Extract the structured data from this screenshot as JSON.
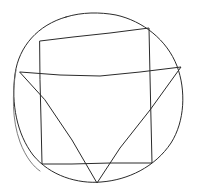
{
  "image": {
    "title": "Hand-drawn geometric figure",
    "description": "A pencil-style sketch of a circle containing an inscribed quadrilateral and an inscribed downward-pointing triangle",
    "width": 198,
    "height": 194,
    "background_color": "#ffffff",
    "medium": "pencil-sketch"
  },
  "style": {
    "stroke_color": "#2b2b2b",
    "stroke_color_light": "#6e6e6e",
    "stroke_width": 1,
    "stroke_width_light": 0.9
  },
  "shapes": {
    "circle": {
      "name": "circle",
      "center_x": 99,
      "center_y": 96,
      "radius_x": 85,
      "radius_y": 84,
      "top_y": 12,
      "bottom_y": 180,
      "left_x": 14,
      "right_x": 184,
      "has_double_closure_stroke": true,
      "path": "M 66 17 C 38 25 19 46 15 74 C 11 104 17 134 33 155 C 50 176 78 184 101 182 C 128 180 155 167 171 143 C 185 121 186 90 177 66 C 167 40 143 21 116 15 C 100 12 82 12 66 17 Z",
      "closure_path": "M 16 70 C 12 94 12 120 20 142 C 26 158 34 167 40 171"
    },
    "quadrilateral": {
      "name": "quadrilateral",
      "vertices": [
        {
          "label": "top-left",
          "x": 40,
          "y": 41
        },
        {
          "label": "top-right",
          "x": 149,
          "y": 28
        },
        {
          "label": "bottom-right",
          "x": 152,
          "y": 163
        },
        {
          "label": "bottom-left",
          "x": 42,
          "y": 164
        }
      ],
      "path": "M 40 41 L 73 37 L 110 33 L 149 28 L 150 76 L 151 120 L 152 163 L 110 163 L 72 164 L 42 164 L 41 120 L 40 80 Z"
    },
    "triangle": {
      "name": "triangle",
      "vertices": [
        {
          "label": "left",
          "x": 20,
          "y": 72
        },
        {
          "label": "right",
          "x": 181,
          "y": 67
        },
        {
          "label": "apex-bottom",
          "x": 97,
          "y": 183
        }
      ],
      "top_edge_is_wavy": true,
      "path": "M 20 72 L 60 75 L 100 76 L 140 72 L 181 67 L 150 110 L 120 148 L 97 183 L 72 140 L 45 100 Z"
    }
  },
  "intersections": {
    "description": "The quadrilateral and triangle both sit inside the circle; the triangle's left and right vertices touch the circle edge and its apex extends slightly past the circle bottom",
    "triangle_apex_below_circle": true
  }
}
